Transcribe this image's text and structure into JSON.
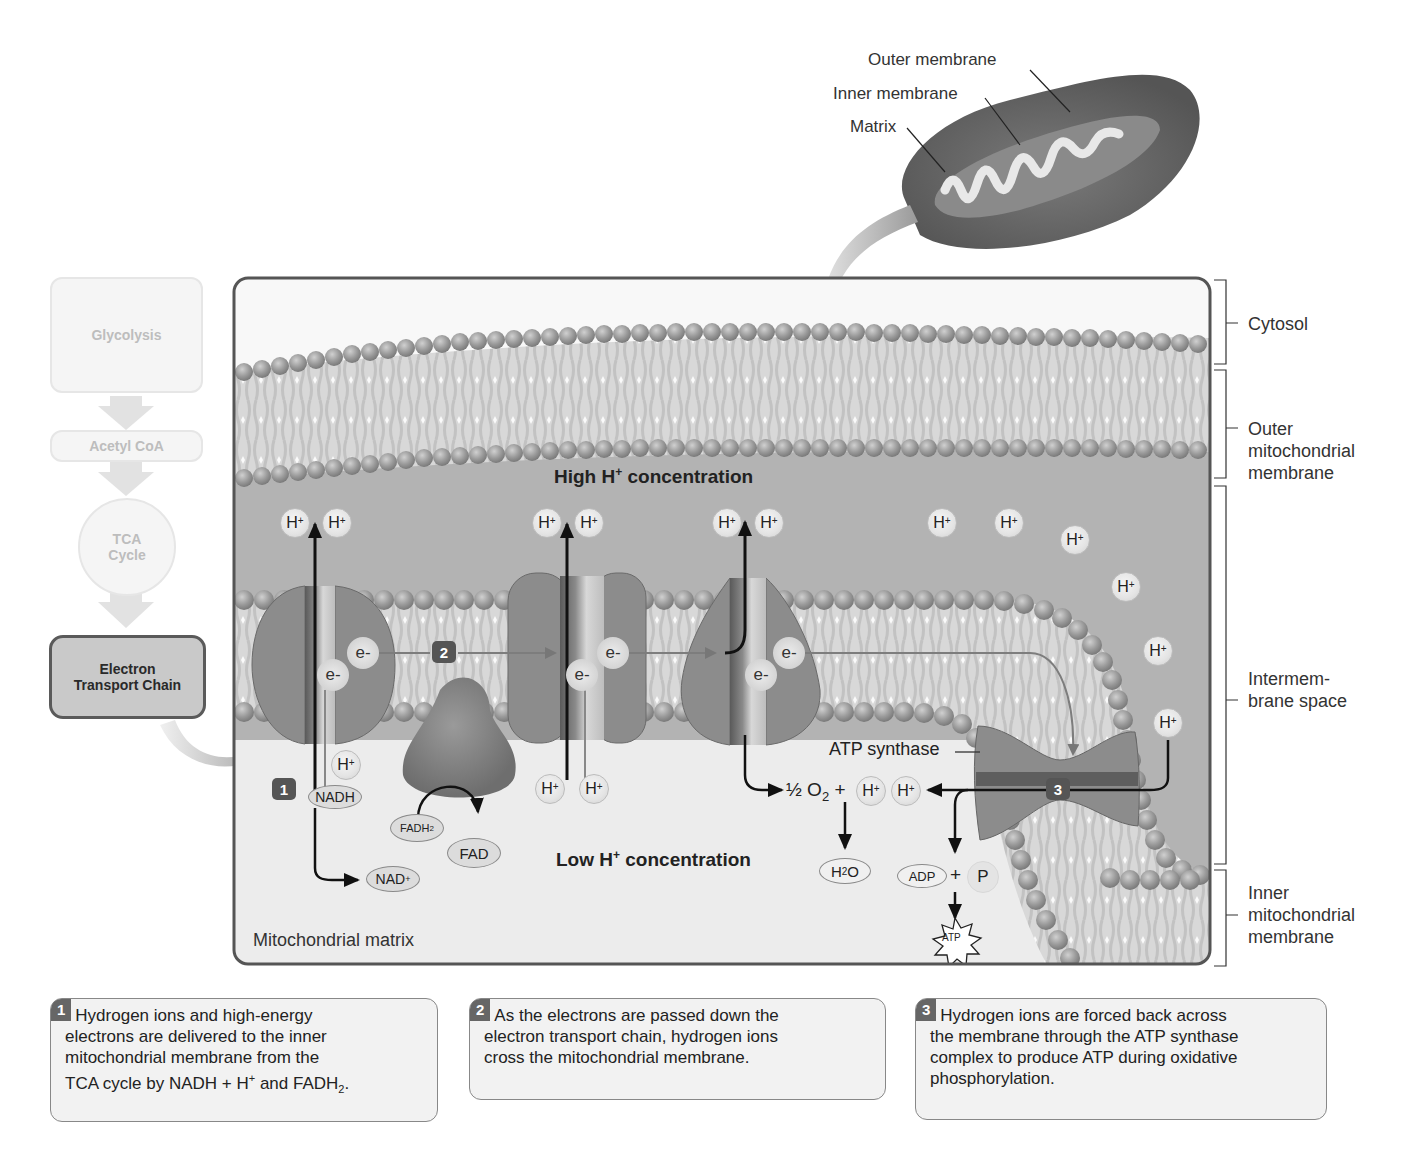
{
  "mitochondrion_inset": {
    "labels": {
      "outer_membrane": "Outer membrane",
      "inner_membrane": "Inner membrane",
      "matrix": "Matrix"
    }
  },
  "pathway": {
    "steps": [
      {
        "label": "Glycolysis",
        "active": false
      },
      {
        "label": "Acetyl CoA",
        "active": false
      },
      {
        "label_line1": "TCA",
        "label_line2": "Cycle",
        "active": false
      },
      {
        "label_line1": "Electron",
        "label_line2": "Transport Chain",
        "active": true
      }
    ]
  },
  "regions": {
    "cytosol": "Cytosol",
    "outer_membrane": [
      "Outer",
      "mitochondrial",
      "membrane"
    ],
    "intermembrane_space": [
      "Intermem-",
      "brane space"
    ],
    "inner_membrane": [
      "Inner",
      "mitochondrial",
      "membrane"
    ]
  },
  "diagram": {
    "high_conc": {
      "prefix": "High H",
      "sup": "+",
      "suffix": " concentration"
    },
    "low_conc": {
      "prefix": "Low H",
      "sup": "+",
      "suffix": " concentration"
    },
    "matrix_label": "Mitochondrial matrix",
    "ion_label": "H",
    "ion_charge": "+",
    "electron_label": "e-",
    "molecules": {
      "nadh": "NADH",
      "nad_plus": {
        "base": "NAD",
        "sup": "+"
      },
      "fadh2": {
        "base": "FADH",
        "sub": "2"
      },
      "fad": "FAD",
      "h2o": {
        "a": "H",
        "sub": "2",
        "b": "O"
      },
      "adp": "ADP",
      "p": "P",
      "atp": "ATP"
    },
    "oxygen_eq": {
      "half": "½ O",
      "sub": "2",
      "plus": " +"
    },
    "plus_sign": "+",
    "atp_synthase_label": "ATP synthase",
    "step_badges": [
      "1",
      "2",
      "3"
    ]
  },
  "step_descriptions": [
    {
      "num": "1",
      "text_lines": [
        "Hydrogen ions and high-energy",
        "electrons are delivered to the inner",
        "mitochondrial membrane from the"
      ],
      "last_line": {
        "pre": "TCA cycle by NADH + H",
        "sup": "+",
        "mid": " and FADH",
        "sub": "2",
        "post": "."
      }
    },
    {
      "num": "2",
      "text_lines": [
        "As the electrons are passed down the",
        "electron transport chain, hydrogen ions",
        "cross the mitochondrial membrane."
      ]
    },
    {
      "num": "3",
      "text_lines": [
        "Hydrogen ions are forced back across",
        "the membrane through the ATP synthase",
        "complex to produce ATP during oxidative",
        "phosphorylation."
      ]
    }
  ],
  "colors": {
    "membrane_head": "#9a9a9a",
    "protein": "#8c8c8c",
    "intermembrane": "#b4b4b4",
    "matrix": "#ececec",
    "mito_body": "#6f6f6f"
  }
}
